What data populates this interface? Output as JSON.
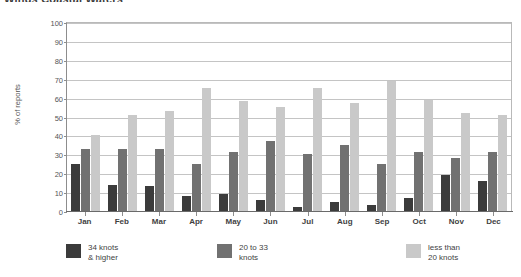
{
  "chart": {
    "title": "Winds  Coastal Waters",
    "ylabel": "% of reports"
  },
  "chart_data": {
    "type": "bar",
    "title": "Winds  Coastal Waters",
    "xlabel": "",
    "ylabel": "% of reports",
    "ylim": [
      0,
      100
    ],
    "ytick_step": 10,
    "grid": true,
    "legend_position": "bottom",
    "categories": [
      "Jan",
      "Feb",
      "Mar",
      "Apr",
      "May",
      "Jun",
      "Jul",
      "Aug",
      "Sep",
      "Oct",
      "Nov",
      "Dec"
    ],
    "series": [
      {
        "name": "34 knots\n& higher",
        "color": "#3b3b3b",
        "values": [
          25,
          14,
          13,
          8,
          9,
          6,
          2,
          5,
          3,
          7,
          19,
          16
        ]
      },
      {
        "name": "20 to 33\nknots",
        "color": "#717171",
        "values": [
          33,
          33,
          33,
          25,
          31,
          37,
          30,
          35,
          25,
          31,
          28,
          31
        ]
      },
      {
        "name": "less than\n20 knots",
        "color": "#c9c9c9",
        "values": [
          40,
          51,
          53,
          65,
          58,
          55,
          65,
          57,
          69,
          59,
          52,
          51
        ]
      }
    ],
    "yticks": [
      0,
      10,
      20,
      30,
      40,
      50,
      60,
      70,
      80,
      90,
      100
    ]
  },
  "legend": [
    {
      "label": "34 knots\n& higher",
      "color": "#3b3b3b"
    },
    {
      "label": "20 to 33\nknots",
      "color": "#717171"
    },
    {
      "label": "less than\n20 knots",
      "color": "#c9c9c9"
    }
  ]
}
